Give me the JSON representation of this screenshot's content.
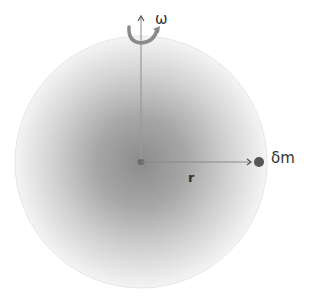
{
  "diagram": {
    "labels": {
      "omega": "ω",
      "mass_element": "δm",
      "radius": "r"
    },
    "colors": {
      "sphere_center": "#8c8c8c",
      "sphere_edge": "#f2f2f2",
      "axis_line": "#9a9a9a",
      "rotation_arrow": "#8a8a8a",
      "mass_dot": "#555555",
      "text": "#333333"
    },
    "geometry": {
      "sphere_center": [
        141,
        162
      ],
      "sphere_radius": 126,
      "axis_top": [
        141,
        14
      ],
      "radius_end": [
        252,
        162
      ],
      "mass_dot_center": [
        259,
        162
      ]
    }
  }
}
